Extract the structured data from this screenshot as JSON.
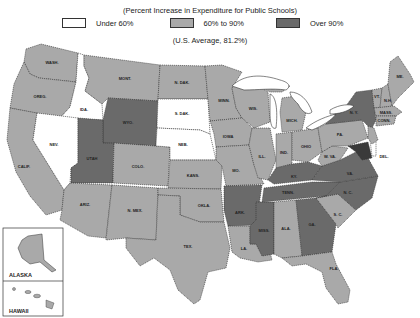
{
  "title": "(Percent Increase in Expenditure for Public Schools)",
  "legend": [
    {
      "label": "Under 60%",
      "color": "#ffffff"
    },
    {
      "label": "60% to 90%",
      "color": "#a9a9a9"
    },
    {
      "label": "Over 90%",
      "color": "#6a6a6a"
    }
  ],
  "average": "(U.S. Average, 81.2%)",
  "colors": {
    "low": "#ffffff",
    "mid": "#a9a9a9",
    "high": "#6a6a6a",
    "water": "#ffffff",
    "border": "#333333"
  },
  "states": [
    {
      "abbr": "WASH.",
      "category": "60% to 90%"
    },
    {
      "abbr": "ORE.",
      "category": "60% to 90%"
    },
    {
      "abbr": "CALIF.",
      "category": "60% to 90%"
    },
    {
      "abbr": "IDA.",
      "category": "Under 60%"
    },
    {
      "abbr": "NEV.",
      "category": "Under 60%"
    },
    {
      "abbr": "MONT.",
      "category": "60% to 90%"
    },
    {
      "abbr": "WYO.",
      "category": "Over 90%"
    },
    {
      "abbr": "UTAH",
      "category": "Over 90%"
    },
    {
      "abbr": "COLO.",
      "category": "60% to 90%"
    },
    {
      "abbr": "ARIZ.",
      "category": "60% to 90%"
    },
    {
      "abbr": "N. MEX.",
      "category": "60% to 90%"
    },
    {
      "abbr": "N. DAK.",
      "category": "60% to 90%"
    },
    {
      "abbr": "S. DAK.",
      "category": "Under 60%"
    },
    {
      "abbr": "NEB.",
      "category": "Under 60%"
    },
    {
      "abbr": "KANS.",
      "category": "60% to 90%"
    },
    {
      "abbr": "OKLA.",
      "category": "60% to 90%"
    },
    {
      "abbr": "TEX.",
      "category": "60% to 90%"
    },
    {
      "abbr": "MINN.",
      "category": "60% to 90%"
    },
    {
      "abbr": "IOWA",
      "category": "60% to 90%"
    },
    {
      "abbr": "MO.",
      "category": "60% to 90%"
    },
    {
      "abbr": "ARK.",
      "category": "Over 90%"
    },
    {
      "abbr": "LA.",
      "category": "60% to 90%"
    },
    {
      "abbr": "WIS.",
      "category": "60% to 90%"
    },
    {
      "abbr": "ILL.",
      "category": "60% to 90%"
    },
    {
      "abbr": "MICH.",
      "category": "60% to 90%"
    },
    {
      "abbr": "IND.",
      "category": "60% to 90%"
    },
    {
      "abbr": "OHIO",
      "category": "60% to 90%"
    },
    {
      "abbr": "KY.",
      "category": "Over 90%"
    },
    {
      "abbr": "TENN.",
      "category": "Over 90%"
    },
    {
      "abbr": "MISS.",
      "category": "Over 90%"
    },
    {
      "abbr": "ALA.",
      "category": "60% to 90%"
    },
    {
      "abbr": "GA.",
      "category": "Over 90%"
    },
    {
      "abbr": "FLA.",
      "category": "60% to 90%"
    },
    {
      "abbr": "S. C.",
      "category": "60% to 90%"
    },
    {
      "abbr": "N. C.",
      "category": "Over 90%"
    },
    {
      "abbr": "VA.",
      "category": "Over 90%"
    },
    {
      "abbr": "W. VA.",
      "category": "60% to 90%"
    },
    {
      "abbr": "PA.",
      "category": "60% to 90%"
    },
    {
      "abbr": "N. Y.",
      "category": "Over 90%"
    },
    {
      "abbr": "MD.",
      "category": "Over 90%"
    },
    {
      "abbr": "DEL.",
      "category": "Under 60%"
    },
    {
      "abbr": "N. J.",
      "category": "60% to 90%"
    },
    {
      "abbr": "CONN.",
      "category": "60% to 90%"
    },
    {
      "abbr": "MASS.",
      "category": "60% to 90%"
    },
    {
      "abbr": "VT.",
      "category": "60% to 90%"
    },
    {
      "abbr": "N. H.",
      "category": "60% to 90%"
    },
    {
      "abbr": "ME.",
      "category": "60% to 90%"
    },
    {
      "abbr": "ALASKA",
      "category": "60% to 90%"
    },
    {
      "abbr": "HAWAII",
      "category": "60% to 90%"
    }
  ],
  "labels": {
    "wash": "WASH.",
    "ore": "OREG.",
    "calif": "CALIF.",
    "ida": "IDA.",
    "nev": "NEV.",
    "mont": "MONT.",
    "wyo": "WYO.",
    "utah": "UTAH",
    "colo": "COLO.",
    "ariz": "ARIZ.",
    "nmex": "N. MEX.",
    "ndak": "N. DAK.",
    "sdak": "S. DAK.",
    "neb": "NEB.",
    "kans": "KANS.",
    "okla": "OKLA.",
    "tex": "TEX.",
    "minn": "MINN.",
    "iowa": "IOWA",
    "mo": "MO.",
    "ark": "ARK.",
    "la": "LA.",
    "wis": "WIS.",
    "ill": "ILL.",
    "mich": "MICH.",
    "ind": "IND.",
    "ohio": "OHIO",
    "ky": "KY.",
    "tenn": "TENN.",
    "miss": "MISS.",
    "ala": "ALA.",
    "ga": "GA.",
    "fla": "FLA.",
    "sc": "S. C.",
    "nc": "N. C.",
    "va": "VA.",
    "wva": "W. VA.",
    "pa": "PA.",
    "ny": "N. Y.",
    "del": "DEL.",
    "me": "ME.",
    "vt": "VT.",
    "nh": "N.H.",
    "mass": "MASS.",
    "conn": "CONN.",
    "alaska": "ALASKA",
    "hawaii": "HAWAII"
  }
}
